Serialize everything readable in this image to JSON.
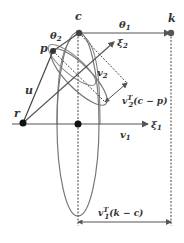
{
  "diagram": {
    "points": {
      "c": {
        "label": "c",
        "x": 79,
        "y": 33
      },
      "p": {
        "label": "p",
        "x": 53,
        "y": 51
      },
      "r": {
        "label": "r",
        "x": 23,
        "y": 123
      },
      "k": {
        "label": "k",
        "x": 171,
        "y": 33
      },
      "o": {
        "label": "",
        "x": 78,
        "y": 124
      }
    },
    "labels": {
      "theta1": "θ",
      "theta1_sub": "1",
      "theta2": "θ",
      "theta2_sub": "2",
      "xi1": "ξ",
      "xi1_sub": "1",
      "xi2": "ξ",
      "xi2_sub": "2",
      "v1": "v",
      "v1_sub": "1",
      "v2": "v",
      "v2_sub": "2",
      "u": "u",
      "proj2": "v",
      "proj2_sub": "2",
      "proj2_sup": "T",
      "proj2_expr": "(c − p)",
      "proj1": "v",
      "proj1_sub": "1",
      "proj1_sup": "T",
      "proj1_expr": "(k − c)"
    },
    "colors": {
      "line": "#555555",
      "ellipse": "#777777",
      "dot": "#222222",
      "text": "#333333"
    }
  }
}
